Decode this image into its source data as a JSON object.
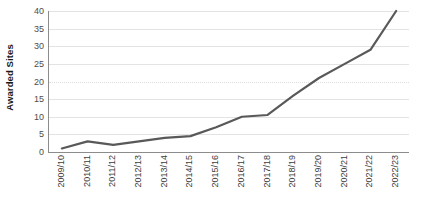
{
  "chart_data": {
    "type": "line",
    "title": "",
    "xlabel": "",
    "ylabel": "Awarded Sites",
    "categories": [
      "2009/10",
      "2010/11",
      "2011/12",
      "2012/13",
      "2013/14",
      "2014/15",
      "2015/16",
      "2016/17",
      "2017/18",
      "2018/19",
      "2019/20",
      "2020/21",
      "2021/22",
      "2022/23"
    ],
    "values": [
      1,
      3,
      2,
      3,
      4,
      4.5,
      7,
      10,
      10.5,
      16,
      21,
      25,
      29,
      40
    ],
    "series": [
      {
        "name": "Awarded Sites",
        "values": [
          1,
          3,
          2,
          3,
          4,
          4.5,
          7,
          10,
          10.5,
          16,
          21,
          25,
          29,
          40
        ],
        "color": "#595959"
      }
    ],
    "ylim": [
      0,
      40
    ],
    "yticks": [
      0,
      5,
      10,
      15,
      20,
      25,
      30,
      35,
      40
    ],
    "ytick_labels": [
      "0",
      "5",
      "10",
      "15",
      "20",
      "25",
      "30",
      "35",
      "40"
    ],
    "xlim_categories": 14,
    "grid": true,
    "grid_axis": "y",
    "grid_color": "#e3e3e3",
    "legend": false,
    "legend_position": "none",
    "line_color": "#595959",
    "line_width": 2.2,
    "markers": false,
    "axis_color": "#8c8c8c",
    "background": "#ffffff",
    "xtick_rotation": -90
  }
}
